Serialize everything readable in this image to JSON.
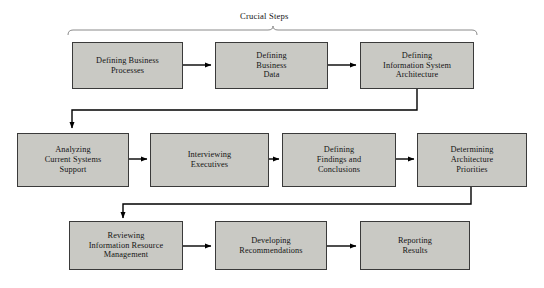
{
  "diagram": {
    "title": "Crucial Steps",
    "background_color": "#ffffff",
    "node_fill_color": "#c9c9c4",
    "node_border_color": "#3a3a3a",
    "connector_color": "#000000",
    "group_brace": {
      "label": "Crucial Steps",
      "spans_nodes": [
        "defining-business-processes",
        "defining-business-data",
        "defining-information-system-architecture"
      ]
    },
    "rows": [
      {
        "id": "row-1",
        "nodes": [
          {
            "id": "defining-business-processes",
            "label": "Defining Business\nProcesses"
          },
          {
            "id": "defining-business-data",
            "label": "Defining\nBusiness\nData"
          },
          {
            "id": "defining-information-system-architecture",
            "label": "Defining\nInformation System\nArchitecture"
          }
        ]
      },
      {
        "id": "row-2",
        "nodes": [
          {
            "id": "analyzing-current-systems-support",
            "label": "Analyzing\nCurrent Systems\nSupport"
          },
          {
            "id": "interviewing-executives",
            "label": "Interviewing\nExecutives"
          },
          {
            "id": "defining-findings-and-conclusions",
            "label": "Defining\nFindings and\nConclusions"
          },
          {
            "id": "determining-architecture-priorities",
            "label": "Determining\nArchitecture\nPriorities"
          }
        ]
      },
      {
        "id": "row-3",
        "nodes": [
          {
            "id": "reviewing-information-resource-management",
            "label": "Reviewing\nInformation Resource\nManagement"
          },
          {
            "id": "developing-recommendations",
            "label": "Developing\nRecommendations"
          },
          {
            "id": "reporting-results",
            "label": "Reporting\nResults"
          }
        ]
      }
    ]
  }
}
